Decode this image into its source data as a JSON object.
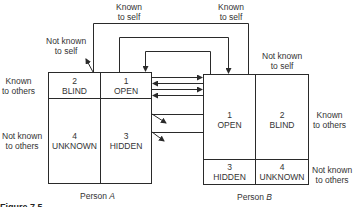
{
  "diagram": {
    "caption": "Figure 7.5",
    "top_labels": {
      "known_to_self_left": [
        "Known",
        "to self"
      ],
      "known_to_self_right": [
        "Known",
        "to self"
      ],
      "not_known_to_self_a": [
        "Not known",
        "to self"
      ],
      "not_known_to_self_b": [
        "Not known",
        "to self"
      ]
    },
    "person_a": {
      "label_prefix": "Person ",
      "label_name": "A",
      "side_labels": {
        "known": [
          "Known",
          "to others"
        ],
        "not_known": [
          "Not known",
          "to others"
        ]
      },
      "cells": [
        {
          "number": "2",
          "name": "BLIND"
        },
        {
          "number": "1",
          "name": "OPEN"
        },
        {
          "number": "4",
          "name": "UNKNOWN"
        },
        {
          "number": "3",
          "name": "HIDDEN"
        }
      ]
    },
    "person_b": {
      "label_prefix": "Person ",
      "label_name": "B",
      "side_labels": {
        "known": [
          "Known",
          "to others"
        ],
        "not_known": [
          "Not known",
          "to others"
        ]
      },
      "cells": [
        {
          "number": "1",
          "name": "OPEN"
        },
        {
          "number": "2",
          "name": "BLIND"
        },
        {
          "number": "3",
          "name": "HIDDEN"
        },
        {
          "number": "4",
          "name": "UNKNOWN"
        }
      ]
    },
    "line_color": "#2a2a2a"
  }
}
